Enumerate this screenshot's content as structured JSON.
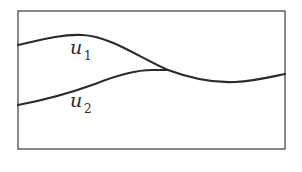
{
  "diagram": {
    "frame": {
      "x": 18,
      "y": 11,
      "width": 267,
      "height": 138,
      "stroke": "#555555"
    },
    "curves": [
      {
        "name": "u1",
        "label": "u",
        "subscript": "1",
        "path": "M18,45 C40,40 62,34 82,35 C110,36 140,58 168,70 C195,80 215,83 235,82 C255,81 270,77 285,74",
        "label_pos": {
          "x": 70,
          "y": 54
        },
        "sub_pos": {
          "x": 84,
          "y": 60
        }
      },
      {
        "name": "u2",
        "label": "u",
        "subscript": "2",
        "path": "M18,105 C45,100 70,93 95,84 C115,76 135,70 152,70 C160,70 164,70 168,70",
        "label_pos": {
          "x": 70,
          "y": 107
        },
        "sub_pos": {
          "x": 84,
          "y": 113
        }
      }
    ],
    "stroke_color": "#2a2a2a"
  }
}
